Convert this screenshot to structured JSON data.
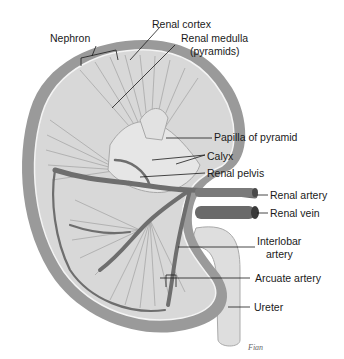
{
  "diagram": {
    "colors": {
      "background": "#ffffff",
      "capsule": "#9a9a9a",
      "cortex": "#d8d8d8",
      "medulla": "#c4c4c4",
      "vessel": "#6e6e6e",
      "pelvis": "#e6e6e6",
      "ureter": "#dedede",
      "label_text": "#1a1a1a",
      "leader_line": "#1a1a1a"
    },
    "labels": [
      {
        "id": "nephron",
        "text": "Nephron"
      },
      {
        "id": "renal-cortex",
        "text": "Renal cortex"
      },
      {
        "id": "renal-medulla",
        "text": "Renal medulla"
      },
      {
        "id": "renal-medulla-sub",
        "text": "(pyramids)"
      },
      {
        "id": "papilla",
        "text": "Papilla of pyramid"
      },
      {
        "id": "calyx",
        "text": "Calyx"
      },
      {
        "id": "renal-pelvis",
        "text": "Renal pelvis"
      },
      {
        "id": "renal-artery",
        "text": "Renal artery"
      },
      {
        "id": "renal-vein",
        "text": "Renal vein"
      },
      {
        "id": "interlobar",
        "text": "Interlobar"
      },
      {
        "id": "interlobar-sub",
        "text": "artery"
      },
      {
        "id": "arcuate",
        "text": "Arcuate artery"
      },
      {
        "id": "ureter",
        "text": "Ureter"
      }
    ],
    "signature": "Fian"
  }
}
